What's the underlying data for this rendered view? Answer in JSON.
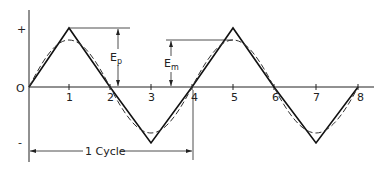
{
  "diagram": {
    "type": "waveform",
    "y_axis": {
      "plus_label": "+",
      "zero_label": "O",
      "minus_label": "-"
    },
    "x_axis": {
      "tick_labels": [
        "1",
        "2",
        "3",
        "4",
        "5",
        "6",
        "7",
        "8"
      ]
    },
    "annotations": {
      "peak": {
        "main": "E",
        "sub": "p"
      },
      "mean": {
        "main": "E",
        "sub": "m"
      },
      "cycle": "1 Cycle"
    },
    "series": [
      {
        "name": "triangle-wave",
        "style": "solid"
      },
      {
        "name": "sine-wave",
        "style": "dashed"
      }
    ]
  }
}
